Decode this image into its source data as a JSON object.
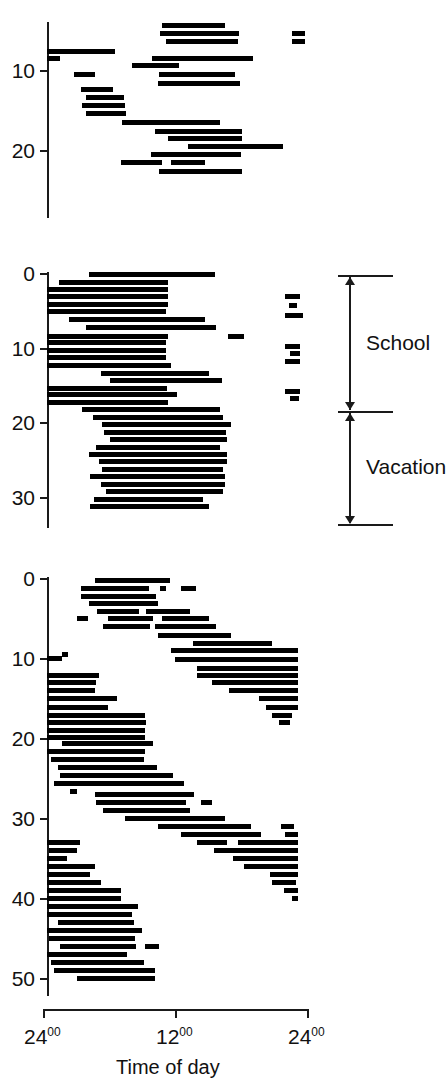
{
  "figure": {
    "type": "actogram",
    "bar_color": "#000000",
    "axis_color": "#1a1a1a",
    "background": "#ffffff"
  },
  "xaxis": {
    "title": "Time of day",
    "ticks": [
      {
        "value": 0,
        "label": "24",
        "sup": "00"
      },
      {
        "value": 12,
        "label": "12",
        "sup": "00"
      },
      {
        "value": 24,
        "label": "24",
        "sup": "00"
      }
    ],
    "range": [
      0,
      24
    ]
  },
  "annotation": {
    "bracket_top_label": "School",
    "bracket_bottom_label": "Vacation"
  },
  "chart_data": {
    "type": "bar",
    "title": "Time of day",
    "xlabel": "Time of day",
    "ylabel": "Day number",
    "xlim": [
      0,
      24
    ],
    "grid": false,
    "legend": null,
    "panels": [
      {
        "name": "panel-top",
        "ylim": [
          4,
          27
        ],
        "yticks": [
          10,
          20
        ],
        "episodes": [
          {
            "day": 4.4,
            "start": 10.6,
            "end": 16.4
          },
          {
            "day": 5.4,
            "start": 10.4,
            "end": 17.7
          },
          {
            "day": 5.4,
            "start": 22.6,
            "end": 23.8
          },
          {
            "day": 6.4,
            "start": 11.0,
            "end": 17.6
          },
          {
            "day": 6.4,
            "start": 22.6,
            "end": 23.8
          },
          {
            "day": 7.6,
            "start": 0.0,
            "end": 6.3
          },
          {
            "day": 8.5,
            "start": 9.7,
            "end": 19.0
          },
          {
            "day": 8.5,
            "start": 0.0,
            "end": 1.2
          },
          {
            "day": 9.4,
            "start": 7.8,
            "end": 12.2
          },
          {
            "day": 10.5,
            "start": 2.5,
            "end": 4.4
          },
          {
            "day": 10.5,
            "start": 10.3,
            "end": 17.4
          },
          {
            "day": 11.6,
            "start": 10.2,
            "end": 17.8
          },
          {
            "day": 12.4,
            "start": 3.1,
            "end": 6.1
          },
          {
            "day": 13.4,
            "start": 3.6,
            "end": 7.1
          },
          {
            "day": 14.4,
            "start": 3.2,
            "end": 7.2
          },
          {
            "day": 15.4,
            "start": 3.6,
            "end": 7.3
          },
          {
            "day": 16.5,
            "start": 6.9,
            "end": 16.0
          },
          {
            "day": 17.6,
            "start": 10.0,
            "end": 18.0
          },
          {
            "day": 18.5,
            "start": 11.2,
            "end": 18.0
          },
          {
            "day": 19.5,
            "start": 13.0,
            "end": 21.8
          },
          {
            "day": 20.5,
            "start": 9.6,
            "end": 17.9
          },
          {
            "day": 21.5,
            "start": 6.8,
            "end": 10.6
          },
          {
            "day": 21.5,
            "start": 11.4,
            "end": 14.6
          },
          {
            "day": 22.6,
            "start": 10.3,
            "end": 18.0
          }
        ]
      },
      {
        "name": "panel-middle",
        "ylim": [
          0,
          33
        ],
        "yticks": [
          0,
          10,
          20,
          30
        ],
        "episodes": [
          {
            "day": 0.2,
            "start": 3.9,
            "end": 15.5
          },
          {
            "day": 1.2,
            "start": 1.1,
            "end": 11.2
          },
          {
            "day": 2.1,
            "start": 0.0,
            "end": 11.2
          },
          {
            "day": 3.1,
            "start": 0.0,
            "end": 11.2
          },
          {
            "day": 3.1,
            "start": 22.0,
            "end": 23.4
          },
          {
            "day": 4.1,
            "start": 0.0,
            "end": 11.2
          },
          {
            "day": 4.3,
            "start": 22.3,
            "end": 23.1
          },
          {
            "day": 5.1,
            "start": 0.0,
            "end": 11.0
          },
          {
            "day": 5.6,
            "start": 22.0,
            "end": 23.6
          },
          {
            "day": 6.2,
            "start": 2.0,
            "end": 14.6
          },
          {
            "day": 7.3,
            "start": 3.6,
            "end": 15.6
          },
          {
            "day": 8.4,
            "start": 0.0,
            "end": 11.2
          },
          {
            "day": 8.4,
            "start": 16.7,
            "end": 18.2
          },
          {
            "day": 9.3,
            "start": 0.0,
            "end": 11.0
          },
          {
            "day": 9.8,
            "start": 22.0,
            "end": 23.4
          },
          {
            "day": 10.3,
            "start": 0.0,
            "end": 11.0
          },
          {
            "day": 10.8,
            "start": 22.4,
            "end": 23.4
          },
          {
            "day": 11.3,
            "start": 0.0,
            "end": 11.0
          },
          {
            "day": 11.8,
            "start": 22.0,
            "end": 23.4
          },
          {
            "day": 12.3,
            "start": 0.0,
            "end": 11.4
          },
          {
            "day": 13.4,
            "start": 5.0,
            "end": 15.0
          },
          {
            "day": 14.4,
            "start": 5.8,
            "end": 16.2
          },
          {
            "day": 15.4,
            "start": 0.0,
            "end": 11.1
          },
          {
            "day": 15.9,
            "start": 22.0,
            "end": 23.4
          },
          {
            "day": 16.3,
            "start": 0.0,
            "end": 12.0
          },
          {
            "day": 16.8,
            "start": 22.4,
            "end": 23.3
          },
          {
            "day": 17.3,
            "start": 0.0,
            "end": 11.2
          },
          {
            "day": 18.3,
            "start": 3.2,
            "end": 16.0
          },
          {
            "day": 19.3,
            "start": 4.2,
            "end": 16.2
          },
          {
            "day": 20.3,
            "start": 5.1,
            "end": 17.0
          },
          {
            "day": 21.3,
            "start": 5.3,
            "end": 16.5
          },
          {
            "day": 22.3,
            "start": 5.8,
            "end": 16.6
          },
          {
            "day": 23.3,
            "start": 4.5,
            "end": 16.0
          },
          {
            "day": 24.3,
            "start": 3.9,
            "end": 16.6
          },
          {
            "day": 25.3,
            "start": 4.8,
            "end": 16.6
          },
          {
            "day": 26.3,
            "start": 5.1,
            "end": 16.2
          },
          {
            "day": 27.3,
            "start": 4.0,
            "end": 16.4
          },
          {
            "day": 28.3,
            "start": 5.0,
            "end": 16.4
          },
          {
            "day": 29.3,
            "start": 5.4,
            "end": 16.2
          },
          {
            "day": 30.3,
            "start": 4.3,
            "end": 14.4
          },
          {
            "day": 31.3,
            "start": 4.0,
            "end": 15.0
          }
        ]
      },
      {
        "name": "panel-bottom",
        "ylim": [
          0,
          51
        ],
        "yticks": [
          0,
          10,
          20,
          30,
          40,
          50
        ],
        "episodes": [
          {
            "day": 0.3,
            "start": 4.4,
            "end": 11.4
          },
          {
            "day": 1.2,
            "start": 3.1,
            "end": 9.4
          },
          {
            "day": 1.2,
            "start": 10.4,
            "end": 11.0
          },
          {
            "day": 1.2,
            "start": 12.4,
            "end": 13.8
          },
          {
            "day": 2.2,
            "start": 3.1,
            "end": 10.1
          },
          {
            "day": 3.1,
            "start": 3.9,
            "end": 10.2
          },
          {
            "day": 4.1,
            "start": 4.6,
            "end": 8.5
          },
          {
            "day": 4.1,
            "start": 9.1,
            "end": 13.2
          },
          {
            "day": 5.0,
            "start": 2.8,
            "end": 3.8
          },
          {
            "day": 5.0,
            "start": 5.6,
            "end": 9.8
          },
          {
            "day": 5.0,
            "start": 10.6,
            "end": 15.0
          },
          {
            "day": 6.0,
            "start": 5.2,
            "end": 9.5
          },
          {
            "day": 6.0,
            "start": 10.0,
            "end": 15.6
          },
          {
            "day": 7.1,
            "start": 10.2,
            "end": 17.0
          },
          {
            "day": 8.1,
            "start": 13.5,
            "end": 20.8
          },
          {
            "day": 9.0,
            "start": 11.4,
            "end": 23.2
          },
          {
            "day": 9.5,
            "start": 1.4,
            "end": 1.9
          },
          {
            "day": 10.0,
            "start": 0.0,
            "end": 1.4
          },
          {
            "day": 10.1,
            "start": 11.8,
            "end": 23.2
          },
          {
            "day": 11.2,
            "start": 13.8,
            "end": 23.2
          },
          {
            "day": 12.1,
            "start": 0.0,
            "end": 4.8
          },
          {
            "day": 12.1,
            "start": 13.8,
            "end": 23.2
          },
          {
            "day": 13.0,
            "start": 0.0,
            "end": 4.5
          },
          {
            "day": 13.0,
            "start": 15.2,
            "end": 23.2
          },
          {
            "day": 14.0,
            "start": 0.0,
            "end": 4.4
          },
          {
            "day": 14.0,
            "start": 16.8,
            "end": 23.2
          },
          {
            "day": 15.0,
            "start": 0.0,
            "end": 6.5
          },
          {
            "day": 15.0,
            "start": 19.6,
            "end": 23.2
          },
          {
            "day": 16.1,
            "start": 0.0,
            "end": 5.6
          },
          {
            "day": 16.1,
            "start": 20.2,
            "end": 23.2
          },
          {
            "day": 17.1,
            "start": 0.0,
            "end": 9.0
          },
          {
            "day": 17.1,
            "start": 20.8,
            "end": 22.6
          },
          {
            "day": 18.0,
            "start": 0.0,
            "end": 9.1
          },
          {
            "day": 18.0,
            "start": 21.4,
            "end": 22.4
          },
          {
            "day": 19.0,
            "start": 0.0,
            "end": 9.0
          },
          {
            "day": 19.9,
            "start": 0.0,
            "end": 9.0
          },
          {
            "day": 20.6,
            "start": 1.4,
            "end": 9.8
          },
          {
            "day": 21.6,
            "start": 0.0,
            "end": 9.0
          },
          {
            "day": 22.6,
            "start": 0.4,
            "end": 9.0
          },
          {
            "day": 23.6,
            "start": 1.0,
            "end": 10.2
          },
          {
            "day": 24.6,
            "start": 1.2,
            "end": 11.6
          },
          {
            "day": 25.6,
            "start": 0.6,
            "end": 12.6
          },
          {
            "day": 26.6,
            "start": 2.1,
            "end": 2.8
          },
          {
            "day": 27.0,
            "start": 4.4,
            "end": 13.6
          },
          {
            "day": 28.0,
            "start": 4.5,
            "end": 12.8
          },
          {
            "day": 28.0,
            "start": 14.2,
            "end": 15.2
          },
          {
            "day": 29.0,
            "start": 5.2,
            "end": 13.2
          },
          {
            "day": 30.0,
            "start": 7.2,
            "end": 16.4
          },
          {
            "day": 31.0,
            "start": 10.2,
            "end": 18.8
          },
          {
            "day": 31.0,
            "start": 21.6,
            "end": 22.8
          },
          {
            "day": 32.0,
            "start": 12.4,
            "end": 19.8
          },
          {
            "day": 32.0,
            "start": 22.0,
            "end": 23.2
          },
          {
            "day": 33.0,
            "start": 0.0,
            "end": 3.0
          },
          {
            "day": 33.0,
            "start": 13.8,
            "end": 16.6
          },
          {
            "day": 33.0,
            "start": 17.6,
            "end": 23.2
          },
          {
            "day": 34.0,
            "start": 0.2,
            "end": 2.8
          },
          {
            "day": 34.0,
            "start": 15.4,
            "end": 23.2
          },
          {
            "day": 35.0,
            "start": 0.0,
            "end": 1.8
          },
          {
            "day": 35.0,
            "start": 17.2,
            "end": 23.2
          },
          {
            "day": 36.0,
            "start": 0.0,
            "end": 4.4
          },
          {
            "day": 36.0,
            "start": 18.2,
            "end": 23.2
          },
          {
            "day": 37.0,
            "start": 0.0,
            "end": 4.0
          },
          {
            "day": 37.0,
            "start": 20.6,
            "end": 23.2
          },
          {
            "day": 38.0,
            "start": 0.0,
            "end": 5.0
          },
          {
            "day": 38.0,
            "start": 20.8,
            "end": 23.0
          },
          {
            "day": 39.0,
            "start": 0.0,
            "end": 6.8
          },
          {
            "day": 39.0,
            "start": 21.9,
            "end": 23.2
          },
          {
            "day": 40.0,
            "start": 0.0,
            "end": 6.8
          },
          {
            "day": 40.0,
            "start": 22.6,
            "end": 23.2
          },
          {
            "day": 41.0,
            "start": 0.0,
            "end": 8.4
          },
          {
            "day": 42.0,
            "start": 0.0,
            "end": 7.8
          },
          {
            "day": 43.0,
            "start": 1.0,
            "end": 8.0
          },
          {
            "day": 44.0,
            "start": 0.0,
            "end": 8.8
          },
          {
            "day": 45.0,
            "start": 0.2,
            "end": 8.1
          },
          {
            "day": 46.0,
            "start": 1.2,
            "end": 8.2
          },
          {
            "day": 46.0,
            "start": 9.0,
            "end": 10.3
          },
          {
            "day": 47.0,
            "start": 0.0,
            "end": 7.4
          },
          {
            "day": 48.0,
            "start": 0.4,
            "end": 9.0
          },
          {
            "day": 49.0,
            "start": 0.6,
            "end": 10.0
          },
          {
            "day": 50.0,
            "start": 2.8,
            "end": 10.0
          }
        ]
      }
    ]
  }
}
